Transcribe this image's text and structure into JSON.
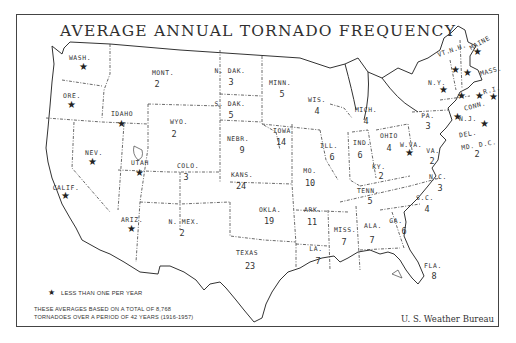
{
  "title": "AVERAGE ANNUAL TORNADO FREQUENCY",
  "legend": {
    "star_icon": "star-icon",
    "star_label": "LESS THAN ONE PER YEAR"
  },
  "note": {
    "line1": "THESE AVERAGES BASED ON A TOTAL OF 8,768",
    "line2": "TORNADOES OVER A PERIOD OF 42 YEARS (1916-1957)"
  },
  "credit": "U. S. Weather Bureau",
  "states": [
    {
      "abbr": "WASH.",
      "value": "★"
    },
    {
      "abbr": "ORE.",
      "value": "★"
    },
    {
      "abbr": "CALIF.",
      "value": "★"
    },
    {
      "abbr": "IDAHO",
      "value": "★"
    },
    {
      "abbr": "NEV.",
      "value": "★"
    },
    {
      "abbr": "UTAH",
      "value": "★"
    },
    {
      "abbr": "ARIZ.",
      "value": "★"
    },
    {
      "abbr": "MONT.",
      "value": "2"
    },
    {
      "abbr": "WYO.",
      "value": "2"
    },
    {
      "abbr": "COLO.",
      "value": "3"
    },
    {
      "abbr": "N. MEX.",
      "value": "2"
    },
    {
      "abbr": "N. DAK.",
      "value": "3"
    },
    {
      "abbr": "S. DAK.",
      "value": "5"
    },
    {
      "abbr": "NEBR.",
      "value": "9"
    },
    {
      "abbr": "KANS.",
      "value": "24"
    },
    {
      "abbr": "OKLA.",
      "value": "19"
    },
    {
      "abbr": "TEXAS",
      "value": "23"
    },
    {
      "abbr": "MINN.",
      "value": "5"
    },
    {
      "abbr": "IOWA",
      "value": "14"
    },
    {
      "abbr": "MO.",
      "value": "10"
    },
    {
      "abbr": "ARK.",
      "value": "11"
    },
    {
      "abbr": "LA.",
      "value": "7"
    },
    {
      "abbr": "WIS.",
      "value": "4"
    },
    {
      "abbr": "ILL.",
      "value": "6"
    },
    {
      "abbr": "MISS.",
      "value": "7"
    },
    {
      "abbr": "MICH.",
      "value": "4"
    },
    {
      "abbr": "IND.",
      "value": "6"
    },
    {
      "abbr": "KY.",
      "value": "2"
    },
    {
      "abbr": "TENN.",
      "value": "5"
    },
    {
      "abbr": "ALA.",
      "value": "7"
    },
    {
      "abbr": "OHIO",
      "value": "4"
    },
    {
      "abbr": "W.VA.",
      "value": "★"
    },
    {
      "abbr": "VA.",
      "value": "2"
    },
    {
      "abbr": "N.C.",
      "value": "3"
    },
    {
      "abbr": "S.C.",
      "value": "4"
    },
    {
      "abbr": "GA.",
      "value": "6"
    },
    {
      "abbr": "FLA.",
      "value": "8"
    },
    {
      "abbr": "PA.",
      "value": "3"
    },
    {
      "abbr": "N.Y.",
      "value": "★"
    },
    {
      "abbr": "VT.",
      "value": "★"
    },
    {
      "abbr": "N.H.",
      "value": "★"
    },
    {
      "abbr": "MAINE",
      "value": "★"
    },
    {
      "abbr": "MASS.",
      "value": "★"
    },
    {
      "abbr": "R.I.",
      "value": "★"
    },
    {
      "abbr": "CONN.",
      "value": "★"
    },
    {
      "abbr": "N.J.",
      "value": "★"
    },
    {
      "abbr": "DEL.",
      "value": "★"
    },
    {
      "abbr": "MD. D.C.",
      "value": "2"
    }
  ]
}
